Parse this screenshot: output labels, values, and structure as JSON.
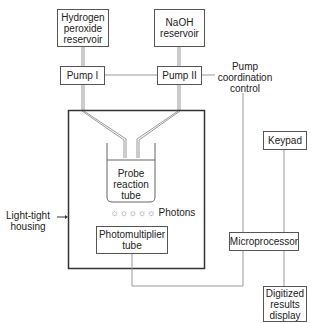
{
  "diagram": {
    "nodes": {
      "h2o2_reservoir": "Hydrogen\nperoxide\nreservoir",
      "naoh_reservoir": "NaOH\nreservoir",
      "pump1": "Pump I",
      "pump2": "Pump II",
      "probe_tube": "Probe\nreaction\ntube",
      "photomultiplier": "Photomultiplier\ntube",
      "microprocessor": "Microprocessor",
      "keypad": "Keypad",
      "display": "Digitized\nresults\ndisplay"
    },
    "labels": {
      "pump_control": "Pump\ncoordination\ncontrol",
      "housing": "Light-tight\nhousing",
      "photons": "Photons",
      "photon_glyphs": "☼☼☼☼☼"
    },
    "colors": {
      "line": "#8a8a8a",
      "box_border": "#555555",
      "housing_border": "#333333",
      "text": "#222222"
    }
  }
}
